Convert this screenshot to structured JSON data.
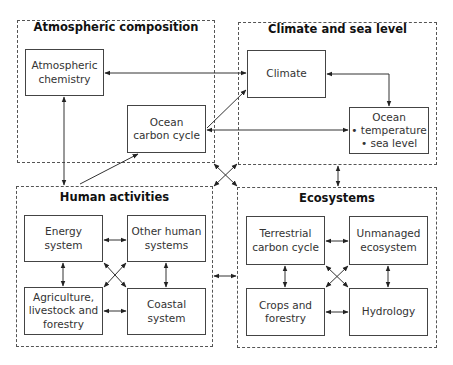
{
  "groups": {
    "atmospheric": {
      "title": "Atmospheric composition"
    },
    "climate": {
      "title": "Climate and sea level"
    },
    "human": {
      "title": "Human activities"
    },
    "ecosystems": {
      "title": "Ecosystems"
    }
  },
  "nodes": {
    "atmospheric_chemistry": "Atmospheric\nchemistry",
    "ocean_carbon_cycle": "Ocean\ncarbon cycle",
    "climate": "Climate",
    "ocean_temp": "Ocean\n• temperature\n• sea level",
    "energy_system": "Energy\nsystem",
    "other_human_systems": "Other human\nsystems",
    "agriculture": "Agriculture,\nlivestock and\nforestry",
    "coastal_system": "Coastal\nsystem",
    "terrestrial_carbon_cycle": "Terrestrial\ncarbon cycle",
    "unmanaged_ecosystem": "Unmanaged\necosystem",
    "crops_forestry": "Crops and\nforestry",
    "hydrology": "Hydrology"
  },
  "colors": {
    "line": "#333333",
    "dash": "#555555"
  }
}
